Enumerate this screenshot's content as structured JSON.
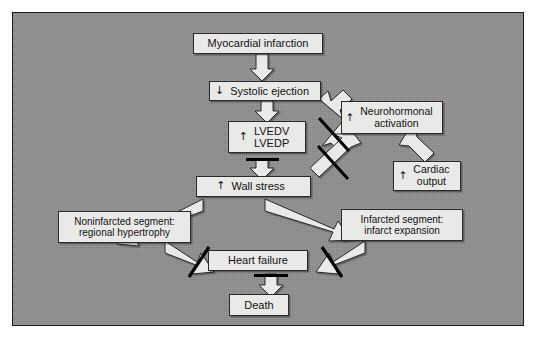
{
  "figure": {
    "type": "flowchart",
    "panel_color": "#8f8f8f",
    "node_fill": "#e9e9e7",
    "node_border": "#2a2a2a",
    "arrow_fill": "#e9e9e7",
    "inhibition_color": "#000000"
  },
  "nodes": {
    "myocardial_infarction": {
      "label": "Myocardial infarction",
      "arrow": ""
    },
    "systolic_ejection": {
      "label": "Systolic ejection",
      "arrow": "↓"
    },
    "lvedv_lvedp": {
      "label": "LVEDV\nLVEDP",
      "arrow": "↑"
    },
    "neurohormonal_activation": {
      "label": "Neurohormonal\nactivation",
      "arrow": "↑"
    },
    "cardiac_output": {
      "label": "Cardiac\noutput",
      "arrow": "↑"
    },
    "wall_stress": {
      "label": "Wall stress",
      "arrow": "↑"
    },
    "noninfarcted_segment": {
      "label": "Noninfarcted segment:\nregional hypertrophy",
      "arrow": ""
    },
    "infarcted_segment": {
      "label": "Infarcted segment:\ninfarct expansion",
      "arrow": ""
    },
    "heart_failure": {
      "label": "Heart failure",
      "arrow": ""
    },
    "death": {
      "label": "Death",
      "arrow": ""
    }
  },
  "edges": [
    {
      "name": "mi-to-systolic-ejection",
      "from": "myocardial_infarction",
      "to": "systolic_ejection",
      "kind": "block-arrow",
      "inhibited": false
    },
    {
      "name": "systolic-ejection-to-lvedv",
      "from": "systolic_ejection",
      "to": "lvedv_lvedp",
      "kind": "block-arrow",
      "inhibited": false
    },
    {
      "name": "systolic-ejection-to-neurohormonal",
      "from": "systolic_ejection",
      "to": "neurohormonal_activation",
      "kind": "block-arrow",
      "inhibited": false
    },
    {
      "name": "neurohormonal-to-lvedv",
      "from": "neurohormonal_activation",
      "to": "lvedv_lvedp",
      "kind": "block-arrow",
      "inhibited": true
    },
    {
      "name": "neurohormonal-to-cardiac-output",
      "from": "neurohormonal_activation",
      "to": "cardiac_output",
      "kind": "block-arrow",
      "inhibited": false
    },
    {
      "name": "neurohormonal-to-wall-stress",
      "from": "neurohormonal_activation",
      "to": "wall_stress",
      "kind": "block-arrow",
      "inhibited": true
    },
    {
      "name": "lvedv-to-wall-stress",
      "from": "lvedv_lvedp",
      "to": "wall_stress",
      "kind": "block-arrow",
      "inhibited": true
    },
    {
      "name": "wall-stress-to-noninfarcted",
      "from": "wall_stress",
      "to": "noninfarcted_segment",
      "kind": "block-arrow",
      "inhibited": false
    },
    {
      "name": "wall-stress-to-infarcted",
      "from": "wall_stress",
      "to": "infarcted_segment",
      "kind": "block-arrow",
      "inhibited": false
    },
    {
      "name": "noninfarcted-to-heart-failure",
      "from": "noninfarcted_segment",
      "to": "heart_failure",
      "kind": "block-arrow",
      "inhibited": true
    },
    {
      "name": "infarcted-to-heart-failure",
      "from": "infarcted_segment",
      "to": "heart_failure",
      "kind": "block-arrow",
      "inhibited": true
    },
    {
      "name": "heart-failure-to-death",
      "from": "heart_failure",
      "to": "death",
      "kind": "block-arrow",
      "inhibited": true
    }
  ]
}
